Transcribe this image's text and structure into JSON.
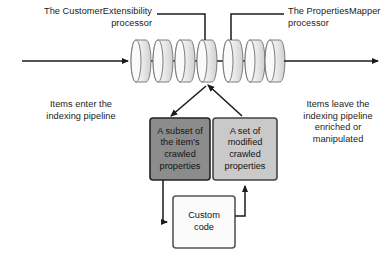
{
  "diagram": {
    "background_color": "#ffffff",
    "text_color": "#1b1b1b"
  },
  "annotations": {
    "customer_extensibility": "The CustomerExtensibility\nprocessor",
    "properties_mapper": "The PropertiesMapper\nprocessor",
    "items_enter": "Items enter the\nindexing pipeline",
    "items_leave": "Items leave the\nindexing pipeline\nenriched or\nmanipulated"
  },
  "pipeline": {
    "name": "indexing-pipeline",
    "stage_count": 7,
    "cylinder_fill_light": "#f4f4f4",
    "cylinder_fill_shade": "#d4d4d4",
    "cylinder_stroke": "#6f6f6f",
    "customer_extensibility_stage_index": 4,
    "properties_mapper_stage_index": 5
  },
  "boxes": {
    "subset": {
      "label": "A subset of\nthe item's\ncrawled\nproperties",
      "fill": "#8c8c8c",
      "stroke": "#222222"
    },
    "modified": {
      "label": "A set of\nmodified\ncrawled\nproperties",
      "fill": "#c9c9c9",
      "stroke": "#444444"
    },
    "custom_code": {
      "label": "Custom\ncode",
      "fill": "#fbfbfb",
      "stroke": "#555555"
    }
  },
  "connectors": {
    "input_arrow": "items-enter-arrow",
    "output_arrow": "items-leave-arrow",
    "pipeline_to_subset": "tap-out-arrow",
    "modified_to_pipeline": "tap-in-arrow",
    "subset_to_custom_code": "subset-to-code-arrow",
    "custom_code_to_modified": "code-to-modified-arrow",
    "line_color": "#1b1b1b"
  }
}
